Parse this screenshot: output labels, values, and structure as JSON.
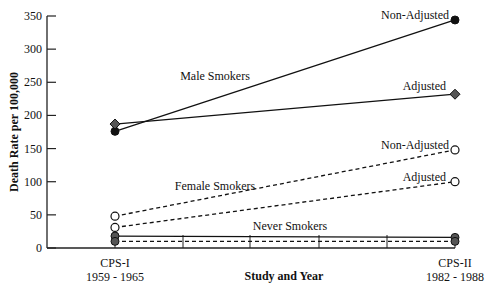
{
  "chart_data": {
    "type": "line",
    "title": "",
    "xlabel": "Study and Year",
    "ylabel": "Death Rate per 100,000",
    "ylim": [
      0,
      350
    ],
    "yticks": [
      0,
      50,
      100,
      150,
      200,
      250,
      300,
      350
    ],
    "categories": [
      "CPS-I 1959 - 1965",
      "CPS-II 1982 - 1988"
    ],
    "category_lines": [
      [
        "CPS-I",
        "1959 - 1965"
      ],
      [
        "CPS-II",
        "1982 - 1988"
      ]
    ],
    "grid": false,
    "series": [
      {
        "name": "Male Smokers Non-Adjusted",
        "group": "Male Smokers",
        "values": [
          176,
          344
        ],
        "line": "solid",
        "marker": "filled-circle"
      },
      {
        "name": "Male Smokers Adjusted",
        "group": "Male Smokers",
        "values": [
          187,
          232
        ],
        "line": "solid",
        "marker": "filled-diamond"
      },
      {
        "name": "Female Smokers Non-Adjusted",
        "group": "Female Smokers",
        "values": [
          48,
          148
        ],
        "line": "dashed",
        "marker": "open-circle"
      },
      {
        "name": "Female Smokers Adjusted",
        "group": "Female Smokers",
        "values": [
          31,
          100
        ],
        "line": "dashed",
        "marker": "open-circle"
      },
      {
        "name": "Never Smokers Non-Adjusted",
        "group": "Never Smokers",
        "values": [
          18,
          16
        ],
        "line": "solid",
        "marker": "filled-circle"
      },
      {
        "name": "Never Smokers Adjusted",
        "group": "Never Smokers",
        "values": [
          10,
          10
        ],
        "line": "dashed",
        "marker": "filled-circle"
      }
    ],
    "annotations": [
      {
        "text": "Male Smokers",
        "x": 215,
        "y": 80
      },
      {
        "text": "Female Smokers",
        "x": 215,
        "y": 190
      },
      {
        "text": "Never Smokers",
        "x": 290,
        "y": 230
      },
      {
        "text": "Non-Adjusted",
        "x": 449,
        "y": 19,
        "anchor": "end"
      },
      {
        "text": "Adjusted",
        "x": 446,
        "y": 90,
        "anchor": "end"
      },
      {
        "text": "Non-Adjusted",
        "x": 449,
        "y": 149,
        "anchor": "end"
      },
      {
        "text": "Adjusted",
        "x": 446,
        "y": 181,
        "anchor": "end"
      }
    ]
  }
}
